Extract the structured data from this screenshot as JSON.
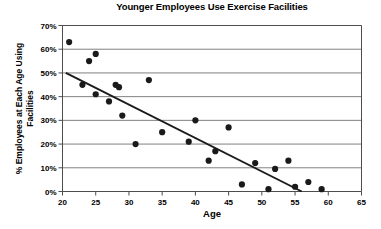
{
  "chart_data": {
    "type": "scatter",
    "title": "Younger Employees Use Exercise Facilities",
    "xlabel": "Age",
    "ylabel": "% Employees at Each Age Using Facilities",
    "ylabel_line1": "% Employees at Each Age Using",
    "ylabel_line2": "Facilities",
    "xlim": [
      20,
      65
    ],
    "ylim": [
      0,
      70
    ],
    "xticks": [
      20,
      25,
      30,
      35,
      40,
      45,
      50,
      55,
      60,
      65
    ],
    "xtick_labels": [
      "20",
      "25",
      "30",
      "35",
      "40",
      "45",
      "50",
      "55",
      "60",
      "65"
    ],
    "yticks": [
      0,
      10,
      20,
      30,
      40,
      50,
      60,
      70
    ],
    "ytick_labels": [
      "0%",
      "10%",
      "20%",
      "30%",
      "40%",
      "50%",
      "60%",
      "70%"
    ],
    "grid": "horizontal",
    "legend": "none",
    "marker_color": "#1a1a1a",
    "trendline_color": "#1a1a1a",
    "grid_color": "#808080",
    "axis_color": "#4d4d4d",
    "x": [
      21,
      23,
      24,
      25,
      25,
      27,
      28,
      28.5,
      29,
      31,
      33,
      35,
      39,
      40,
      42,
      43,
      45,
      47,
      49,
      51,
      52,
      54,
      55,
      57,
      59
    ],
    "y": [
      63,
      45,
      55,
      58,
      41,
      38,
      45,
      44,
      32,
      20,
      47,
      25,
      21,
      30,
      13,
      17,
      27,
      3,
      12,
      1,
      9.5,
      13,
      2,
      4,
      1
    ],
    "points": [
      {
        "age": 21,
        "pct": 63
      },
      {
        "age": 23,
        "pct": 45
      },
      {
        "age": 24,
        "pct": 55
      },
      {
        "age": 25,
        "pct": 58
      },
      {
        "age": 25,
        "pct": 41
      },
      {
        "age": 27,
        "pct": 38
      },
      {
        "age": 28,
        "pct": 45
      },
      {
        "age": 28.5,
        "pct": 44
      },
      {
        "age": 29,
        "pct": 32
      },
      {
        "age": 31,
        "pct": 20
      },
      {
        "age": 33,
        "pct": 47
      },
      {
        "age": 35,
        "pct": 25
      },
      {
        "age": 39,
        "pct": 21
      },
      {
        "age": 40,
        "pct": 30
      },
      {
        "age": 42,
        "pct": 13
      },
      {
        "age": 43,
        "pct": 17
      },
      {
        "age": 45,
        "pct": 27
      },
      {
        "age": 47,
        "pct": 3
      },
      {
        "age": 49,
        "pct": 12
      },
      {
        "age": 51,
        "pct": 1
      },
      {
        "age": 52,
        "pct": 9.5
      },
      {
        "age": 54,
        "pct": 13
      },
      {
        "age": 55,
        "pct": 2
      },
      {
        "age": 57,
        "pct": 4
      },
      {
        "age": 59,
        "pct": 1
      }
    ],
    "trendline": {
      "x0": 20.5,
      "y0": 50,
      "x1": 56,
      "y1": 0
    }
  }
}
